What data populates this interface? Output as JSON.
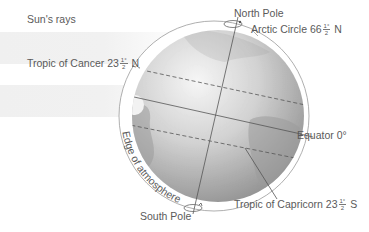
{
  "diagram": {
    "labels": {
      "sun_rays": "Sun's rays",
      "north_pole": "North Pole",
      "south_pole": "South Pole",
      "arctic_circle": {
        "text": "Arctic Circle 66",
        "frac_num": "1°",
        "frac_den": "2",
        "suffix": " N"
      },
      "tropic_cancer": {
        "text": "Tropic of Cancer 23",
        "frac_num": "1°",
        "frac_den": "2",
        "suffix": " N"
      },
      "equator": "Equator 0°",
      "tropic_capricorn": {
        "text": "Tropic of Capricorn 23",
        "frac_num": "1°",
        "frac_den": "2",
        "suffix": " S"
      },
      "atmosphere_edge": "Edge of atmosphere"
    },
    "colors": {
      "globe_light": "#f4f4f4",
      "globe_dark": "#8c8c8c",
      "land": "#9a9a9a",
      "lines": "#555555",
      "ring": "#9a9a9a",
      "rays": "#f0f0f0"
    }
  }
}
